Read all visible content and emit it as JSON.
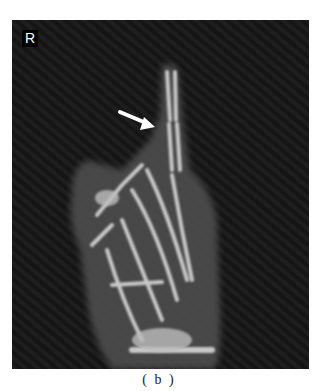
{
  "figure": {
    "side_marker": "R",
    "caption": "( b )",
    "annotation": {
      "type": "arrow",
      "color": "#ffffff",
      "points_to": "finger joint"
    },
    "colors": {
      "background": "#1c1c1c",
      "bone": "#d8d8d8",
      "soft_tissue": "#5a5a5a"
    }
  }
}
